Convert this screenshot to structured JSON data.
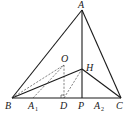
{
  "figure": {
    "points": {
      "A": {
        "label": "A",
        "x": 82,
        "y": 10
      },
      "B": {
        "label": "B",
        "x": 12,
        "y": 98
      },
      "C": {
        "label": "C",
        "x": 121,
        "y": 98
      },
      "P": {
        "label": "P",
        "x": 82,
        "y": 98
      },
      "H": {
        "label": "H",
        "x": 82,
        "y": 69
      },
      "O": {
        "label": "O",
        "x": 64,
        "y": 65
      },
      "D": {
        "label": "D",
        "x": 64,
        "y": 98
      },
      "A1": {
        "label": "A",
        "sub": "1",
        "x": 33,
        "y": 98
      },
      "A2": {
        "label": "A",
        "sub": "2",
        "x": 98,
        "y": 98
      }
    },
    "solid_segments": [
      [
        "A",
        "B"
      ],
      [
        "A",
        "C"
      ],
      [
        "B",
        "C"
      ],
      [
        "A",
        "P"
      ],
      [
        "B",
        "H"
      ],
      [
        "H",
        "C"
      ]
    ],
    "dashed_segments": [
      [
        "B",
        "O"
      ],
      [
        "O",
        "A1"
      ],
      [
        "O",
        "D"
      ],
      [
        "D",
        "H"
      ]
    ],
    "right_angle_marker": "D"
  }
}
